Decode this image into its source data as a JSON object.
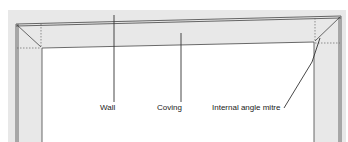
{
  "diagram": {
    "labels": {
      "wall": "Wall",
      "coving": "Coving",
      "mitre": "Internal angle mitre"
    },
    "colors": {
      "shade": "#e6e6e6",
      "line": "#333333",
      "background": "#ffffff"
    }
  }
}
